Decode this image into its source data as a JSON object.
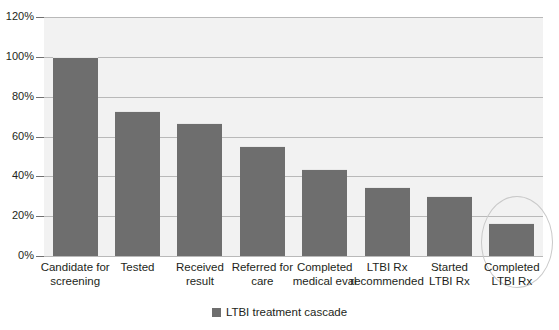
{
  "chart_data": {
    "type": "bar",
    "title": "",
    "subtitle": "",
    "xlabel": "",
    "ylabel": "",
    "ylim": [
      0,
      120
    ],
    "ytick_labels": [
      "120%",
      "100%",
      "80%",
      "60%",
      "40%",
      "20%",
      "0%"
    ],
    "yticks": [
      120,
      100,
      80,
      60,
      40,
      20,
      0
    ],
    "grid": true,
    "legend_position": "bottom-center",
    "categories": [
      "Candidate for screening",
      "Tested",
      "Received result",
      "Referred for care",
      "Completed medical eval",
      "LTBI Rx recommended",
      "Started LTBI Rx",
      "Completed LTBI Rx"
    ],
    "category_lines": [
      [
        "Candidate for",
        "screening"
      ],
      [
        "Tested"
      ],
      [
        "Received",
        "result"
      ],
      [
        "Referred for",
        "care"
      ],
      [
        "Completed",
        "medical eval"
      ],
      [
        "LTBI Rx",
        "recommended"
      ],
      [
        "Started",
        "LTBI Rx"
      ],
      [
        "Completed",
        "LTBI Rx"
      ]
    ],
    "values": [
      100,
      73,
      67,
      55,
      43.5,
      34.5,
      30,
      16.5
    ],
    "series": [
      {
        "name": "LTBI treatment cascade",
        "values": [
          100,
          73,
          67,
          55,
          43.5,
          34.5,
          30,
          16.5
        ]
      }
    ],
    "annotations": [
      {
        "name": "highlight-ellipse",
        "shape": "ellipse",
        "target_category": "Completed LTBI Rx"
      }
    ],
    "colors": {
      "bar": "#6e6e6e",
      "plot_background": "#f2f2f2",
      "gridline": "#b9b9b9",
      "text": "#231f20",
      "page_background": "#ffffff",
      "annotation": "#c9c9c9"
    }
  },
  "legend": {
    "items": [
      {
        "label": "LTBI treatment cascade",
        "color": "#6e6e6e"
      }
    ]
  }
}
